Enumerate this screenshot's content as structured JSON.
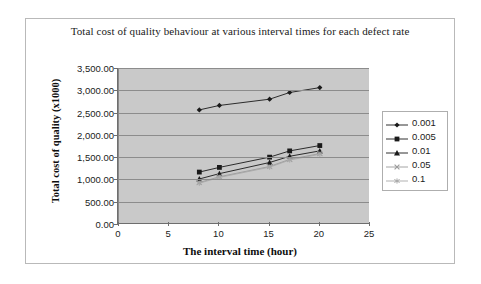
{
  "chart_data": {
    "type": "line",
    "title": "Total cost of quality behaviour at various interval times for each defect rate",
    "xlabel": "The interval time (hour)",
    "ylabel": "Total cost of quality (x1000)",
    "xlim": [
      0,
      25
    ],
    "ylim": [
      0,
      3500
    ],
    "x_ticks": [
      "0",
      "5",
      "10",
      "15",
      "20",
      "25"
    ],
    "y_ticks": [
      "0.00",
      "500.00",
      "1,000.00",
      "1,500.00",
      "2,000.00",
      "2,500.00",
      "3,000.00",
      "3,500.00"
    ],
    "grid": true,
    "legend_position": "right",
    "plot_background": "#c9c9c9",
    "x": [
      8,
      10,
      15,
      17,
      20
    ],
    "series": [
      {
        "name": "0.001",
        "marker": "diamond",
        "color": "#1a1a1a",
        "values": [
          2560,
          2660,
          2800,
          2950,
          3060
        ]
      },
      {
        "name": "0.005",
        "marker": "square",
        "color": "#1a1a1a",
        "values": [
          1165,
          1270,
          1500,
          1640,
          1760
        ]
      },
      {
        "name": "0.01",
        "marker": "triangle",
        "color": "#1a1a1a",
        "values": [
          1010,
          1130,
          1380,
          1520,
          1640
        ]
      },
      {
        "name": "0.05",
        "marker": "cross",
        "color": "#9a9a9a",
        "values": [
          930,
          1060,
          1290,
          1450,
          1580
        ]
      },
      {
        "name": "0.1",
        "marker": "star",
        "color": "#a8a8a8",
        "values": [
          915,
          1045,
          1275,
          1435,
          1565
        ]
      }
    ]
  }
}
